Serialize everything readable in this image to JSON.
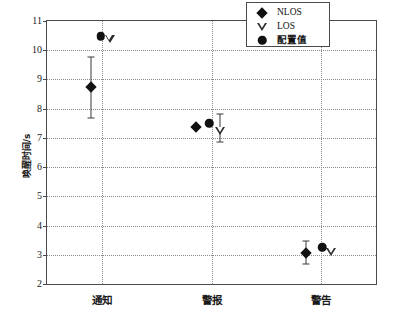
{
  "chart_data": {
    "type": "scatter",
    "title": "",
    "xlabel": "",
    "ylabel": "唤醒时间/s",
    "categories": [
      "通知",
      "警报",
      "警告"
    ],
    "ylim": [
      2,
      11
    ],
    "yticks": [
      2,
      3,
      4,
      5,
      6,
      7,
      8,
      9,
      10,
      11
    ],
    "ytick_labels": [
      "2",
      "3",
      "4",
      "5",
      "6",
      "7",
      "8",
      "9",
      "10",
      "11"
    ],
    "grid": true,
    "grid_style": "dotted",
    "legend_position": "top-right",
    "legend": [
      {
        "label": "NLOS",
        "marker": "filled-diamond"
      },
      {
        "label": "LOS",
        "marker": "open-triangle-down"
      },
      {
        "label": "配置值",
        "marker": "filled-circle"
      }
    ],
    "series": [
      {
        "name": "NLOS",
        "marker": "filled-diamond",
        "points": [
          {
            "category": "通知",
            "x_offset": -0.1,
            "value": 8.75,
            "err_low": 7.68,
            "err_high": 9.78
          },
          {
            "category": "警报",
            "x_offset": -0.14,
            "value": 7.38,
            "err_low": 7.38,
            "err_high": 7.38
          },
          {
            "category": "警告",
            "x_offset": -0.14,
            "value": 3.07,
            "err_low": 2.7,
            "err_high": 3.48
          }
        ]
      },
      {
        "name": "LOS",
        "marker": "open-triangle-down",
        "points": [
          {
            "category": "通知",
            "x_offset": 0.07,
            "value": 10.4,
            "err_low": 10.4,
            "err_high": 10.4
          },
          {
            "category": "警报",
            "x_offset": 0.08,
            "value": 7.25,
            "err_low": 6.85,
            "err_high": 7.82
          },
          {
            "category": "警告",
            "x_offset": 0.09,
            "value": 3.1,
            "err_low": 3.1,
            "err_high": 3.1
          }
        ]
      },
      {
        "name": "配置值",
        "marker": "filled-circle",
        "points": [
          {
            "category": "通知",
            "x_offset": -0.01,
            "value": 10.48
          },
          {
            "category": "警报",
            "x_offset": -0.02,
            "value": 7.5
          },
          {
            "category": "警告",
            "x_offset": 0.01,
            "value": 3.25
          }
        ]
      }
    ]
  }
}
